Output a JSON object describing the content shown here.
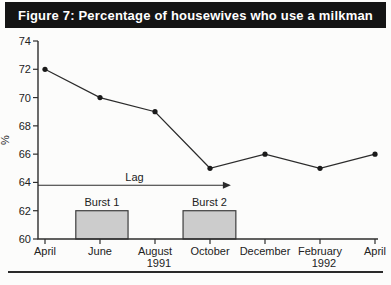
{
  "title": "Figure 7: Percentage of housewives who use a milkman",
  "colors": {
    "title_bg": "#141414",
    "title_fg": "#ffffff",
    "axis": "#2e2e2e",
    "line": "#2b2b2b",
    "marker": "#1a1a1a",
    "bar_fill": "#cccccc",
    "bar_border": "#3d3d3d",
    "text": "#222222",
    "divider": "#2a2a2a"
  },
  "chart_data": {
    "type": "line",
    "title": "Figure 7: Percentage of housewives who use a milkman",
    "ylabel": "%",
    "ylim": [
      60,
      74
    ],
    "yticks": [
      60,
      62,
      64,
      66,
      68,
      70,
      72,
      74
    ],
    "x_tick_labels": [
      "April",
      "June",
      "August",
      "October",
      "December",
      "February",
      "April"
    ],
    "year_labels": [
      {
        "text": "1991",
        "tick": 2
      },
      {
        "text": "1992",
        "tick": 5
      }
    ],
    "series": [
      {
        "name": "percent-housewives-using-milkman",
        "values": [
          72,
          70,
          69,
          65,
          66,
          65,
          66
        ]
      }
    ],
    "bars": [
      {
        "label": "Burst 1",
        "from_tick": 0.56,
        "to_tick": 1.51,
        "top": 62,
        "base": 60
      },
      {
        "label": "Burst 2",
        "from_tick": 2.51,
        "to_tick": 3.47,
        "top": 62,
        "base": 60
      }
    ],
    "arrow": {
      "label": "Lag",
      "y": 63.8,
      "from_tick": -0.13,
      "to_tick": 3.38
    },
    "grid": false,
    "legend": "none"
  }
}
